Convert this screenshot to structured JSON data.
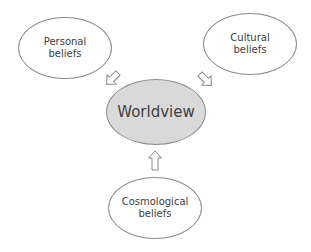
{
  "diagram": {
    "title": "Worldview",
    "nodes": [
      {
        "id": "personal",
        "line1": "Personal",
        "line2": "beliefs"
      },
      {
        "id": "cultural",
        "line1": "Cultural",
        "line2": "beliefs"
      },
      {
        "id": "cosmological",
        "line1": "Cosmological",
        "line2": "beliefs"
      }
    ],
    "center": {
      "label": "Worldview",
      "fill": "#d9d9d9"
    },
    "edges": [
      {
        "from": "personal",
        "to": "center",
        "style": "hollow-arrow"
      },
      {
        "from": "cultural",
        "to": "center",
        "style": "hollow-arrow"
      },
      {
        "from": "cosmological",
        "to": "center",
        "style": "hollow-arrow"
      }
    ],
    "colors": {
      "stroke": "#8a8a8a",
      "text": "#404040",
      "background": "#ffffff"
    }
  }
}
